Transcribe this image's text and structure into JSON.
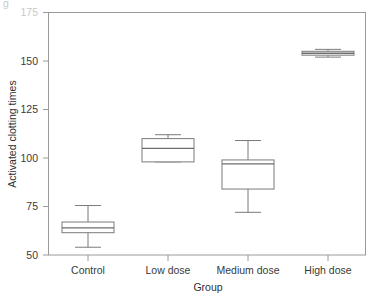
{
  "chart_data": {
    "type": "box",
    "title": "",
    "xlabel": "Group",
    "ylabel": "Activated clotting times",
    "categories": [
      "Control",
      "Low dose",
      "Medium dose",
      "High dose"
    ],
    "ylim": [
      50,
      175
    ],
    "yticks": [
      50,
      75,
      100,
      125,
      150,
      175
    ],
    "ytick_labels": [
      "50",
      "75",
      "100",
      "125",
      "150",
      "175"
    ],
    "grid": false,
    "legend": null,
    "boxes": [
      {
        "category": "Control",
        "whisker_low": 54,
        "q1": 61.5,
        "median": 64,
        "q3": 67,
        "whisker_high": 75.5
      },
      {
        "category": "Low dose",
        "whisker_low": 98,
        "q1": 98,
        "median": 105,
        "q3": 110,
        "whisker_high": 112
      },
      {
        "category": "Medium dose",
        "whisker_low": 72,
        "q1": 84,
        "median": 97,
        "q3": 99,
        "whisker_high": 109
      },
      {
        "category": "High dose",
        "whisker_low": 152,
        "q1": 153,
        "median": 154,
        "q3": 155,
        "whisker_high": 156
      }
    ]
  },
  "axis": {
    "y_title": "Activated clotting times",
    "x_title": "Group",
    "tick_175": "175",
    "tick_150": "150",
    "tick_125": "125",
    "tick_100": "100",
    "tick_75": "75",
    "tick_50": "50",
    "cat_1": "Control",
    "cat_2": "Low dose",
    "cat_3": "Medium dose",
    "cat_4": "High dose"
  },
  "colors": {
    "frame": "#8c8c8c",
    "box_stroke": "#7a7a7a",
    "median_stroke": "#6e6e6e",
    "whisker_stroke": "#7a7a7a",
    "text": "#3a3a3a",
    "background": "#ffffff"
  }
}
